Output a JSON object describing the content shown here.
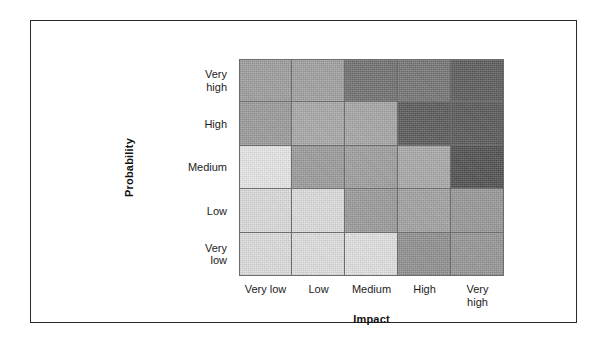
{
  "figure": {
    "background_color": "#ffffff",
    "frame_color": "#2a2a2a",
    "grid_line_color": "#6d6d6d"
  },
  "axes": {
    "y_title": "Probability",
    "x_title": "Impact",
    "y_tick_labels": [
      "Very\nhigh",
      "High",
      "Medium",
      "Low",
      "Very\nlow"
    ],
    "x_tick_labels": [
      "Very low",
      "Low",
      "Medium",
      "High",
      "Very\nhigh"
    ]
  },
  "chart_data": {
    "type": "heatmap",
    "title": "",
    "subtitle": "",
    "xlabel": "Impact",
    "ylabel": "Probability",
    "grid": true,
    "legend": "none",
    "colormap": "grayscale",
    "x_categories": [
      "Very low",
      "Low",
      "Medium",
      "High",
      "Very high"
    ],
    "y_categories": [
      "Very high",
      "High",
      "Medium",
      "Low",
      "Very low"
    ],
    "note": "rows are listed top-to-bottom as drawn; values are the cell fill luminance 0-255 read off the scan",
    "rows": [
      {
        "probability": "Very high",
        "cells": [
          {
            "impact": "Very low",
            "color": "#9d9d9d",
            "gray": 157
          },
          {
            "impact": "Low",
            "color": "#a0a0a0",
            "gray": 160
          },
          {
            "impact": "Medium",
            "color": "#6f6f6f",
            "gray": 111
          },
          {
            "impact": "High",
            "color": "#747474",
            "gray": 116
          },
          {
            "impact": "Very high",
            "color": "#5a5a5a",
            "gray": 90
          }
        ]
      },
      {
        "probability": "High",
        "cells": [
          {
            "impact": "Very low",
            "color": "#9a9a9a",
            "gray": 154
          },
          {
            "impact": "Low",
            "color": "#a8a8a8",
            "gray": 168
          },
          {
            "impact": "Medium",
            "color": "#a6a6a6",
            "gray": 166
          },
          {
            "impact": "High",
            "color": "#585858",
            "gray": 88
          },
          {
            "impact": "Very high",
            "color": "#575757",
            "gray": 87
          }
        ]
      },
      {
        "probability": "Medium",
        "cells": [
          {
            "impact": "Very low",
            "color": "#e8e8e8",
            "gray": 232
          },
          {
            "impact": "Low",
            "color": "#9b9b9b",
            "gray": 155
          },
          {
            "impact": "Medium",
            "color": "#9e9e9e",
            "gray": 158
          },
          {
            "impact": "High",
            "color": "#a9a9a9",
            "gray": 169
          },
          {
            "impact": "Very high",
            "color": "#4e4e4e",
            "gray": 78
          }
        ]
      },
      {
        "probability": "Low",
        "cells": [
          {
            "impact": "Very low",
            "color": "#dcdcdc",
            "gray": 220
          },
          {
            "impact": "Low",
            "color": "#dedede",
            "gray": 222
          },
          {
            "impact": "Medium",
            "color": "#9a9a9a",
            "gray": 154
          },
          {
            "impact": "High",
            "color": "#a2a2a2",
            "gray": 162
          },
          {
            "impact": "Very high",
            "color": "#979797",
            "gray": 151
          }
        ]
      },
      {
        "probability": "Very low",
        "cells": [
          {
            "impact": "Very low",
            "color": "#dedede",
            "gray": 222
          },
          {
            "impact": "Low",
            "color": "#e0e0e0",
            "gray": 224
          },
          {
            "impact": "Medium",
            "color": "#e2e2e2",
            "gray": 226
          },
          {
            "impact": "High",
            "color": "#8f8f8f",
            "gray": 143
          },
          {
            "impact": "Very high",
            "color": "#959595",
            "gray": 149
          }
        ]
      }
    ]
  }
}
